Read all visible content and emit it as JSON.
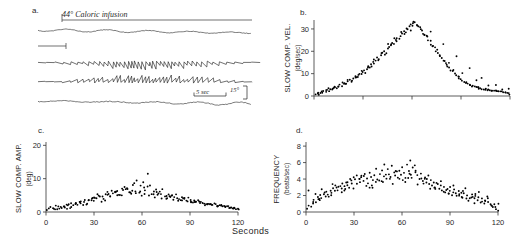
{
  "figure": {
    "xlabel": "Seconds",
    "panels": [
      {
        "id": "a",
        "letter": "a."
      },
      {
        "id": "b",
        "letter": "b."
      },
      {
        "id": "c",
        "letter": "c."
      },
      {
        "id": "d",
        "letter": "d."
      }
    ]
  },
  "panel_a": {
    "letter": "a.",
    "annotation": "44° Caloric infusion",
    "scale_time": "5 sec",
    "scale_amplitude": "15°",
    "trace_count": 4,
    "description": "electro-oculographic nystagmus traces"
  },
  "chart_data": [
    {
      "id": "b",
      "type": "scatter",
      "letter": "b.",
      "title": "",
      "ylabel": "SLOW COMP. VEL.",
      "yunit": "(deg/sec)",
      "xlabel": "",
      "xticks": [
        0,
        30,
        60,
        90,
        120
      ],
      "xticklabels": [
        "",
        "",
        "",
        "",
        ""
      ],
      "yticks": [
        0,
        10,
        20,
        30
      ],
      "yticklabels": [
        "0",
        "10",
        "20",
        "30"
      ],
      "xlim": [
        0,
        120
      ],
      "ylim": [
        0,
        34
      ],
      "grid": false,
      "legend": null,
      "x": [
        1,
        2,
        3,
        4,
        5,
        6,
        7,
        8,
        9,
        10,
        11,
        12,
        13,
        14,
        15,
        16,
        17,
        18,
        19,
        20,
        21,
        22,
        23,
        24,
        25,
        26,
        27,
        28,
        29,
        30,
        31,
        32,
        33,
        34,
        35,
        36,
        37,
        38,
        39,
        40,
        41,
        42,
        43,
        44,
        45,
        46,
        47,
        48,
        49,
        50,
        51,
        52,
        53,
        54,
        55,
        56,
        57,
        58,
        59,
        60,
        61,
        62,
        63,
        64,
        65,
        66,
        67,
        68,
        69,
        70,
        71,
        72,
        73,
        74,
        75,
        76,
        77,
        78,
        79,
        80,
        81,
        82,
        83,
        84,
        85,
        86,
        87,
        88,
        89,
        90,
        91,
        92,
        93,
        94,
        95,
        96,
        97,
        98,
        99,
        100,
        101,
        102,
        103,
        104,
        105,
        106,
        107,
        108,
        109,
        110,
        111,
        112,
        113,
        114,
        115,
        116,
        117,
        118,
        119,
        120,
        5,
        9,
        13,
        17,
        21,
        25,
        29,
        33,
        37,
        41,
        45,
        49,
        53,
        57,
        61,
        65,
        69,
        73,
        77,
        81,
        85,
        89,
        93,
        97,
        101,
        105,
        109,
        113,
        117,
        3,
        11,
        19,
        27,
        35,
        43,
        51,
        59,
        67,
        75,
        83,
        91,
        99,
        107,
        115,
        7,
        15,
        23,
        31,
        39,
        47,
        55,
        63,
        71,
        79,
        87,
        95,
        103,
        111,
        119
      ],
      "y": [
        0.5,
        1.0,
        0.8,
        1.5,
        1.2,
        2.0,
        1.8,
        2.5,
        2.2,
        3.0,
        2.8,
        3.5,
        4.0,
        3.6,
        4.5,
        5.0,
        4.6,
        5.5,
        6.0,
        5.6,
        6.5,
        7.2,
        7.0,
        8.0,
        8.5,
        8.2,
        9.5,
        10.0,
        9.6,
        11.0,
        11.5,
        12.0,
        13.0,
        12.6,
        14.0,
        15.0,
        14.5,
        16.0,
        17.0,
        16.5,
        18.0,
        19.5,
        20.0,
        19.0,
        21.5,
        22.0,
        23.0,
        24.0,
        23.5,
        25.0,
        26.0,
        25.5,
        27.0,
        28.0,
        29.0,
        28.5,
        30.0,
        31.0,
        32.0,
        31.5,
        32.5,
        33.0,
        32.0,
        31.0,
        30.5,
        29.5,
        28.0,
        27.5,
        26.5,
        25.0,
        24.5,
        23.0,
        22.0,
        21.5,
        20.0,
        19.0,
        18.5,
        17.0,
        16.0,
        15.5,
        14.0,
        13.5,
        12.5,
        11.5,
        11.0,
        10.0,
        9.5,
        9.0,
        8.0,
        7.5,
        7.0,
        6.5,
        6.0,
        5.5,
        5.0,
        4.8,
        4.5,
        4.2,
        4.0,
        3.8,
        3.5,
        3.4,
        3.2,
        3.0,
        3.0,
        2.8,
        2.7,
        2.5,
        2.4,
        2.3,
        2.2,
        2.0,
        2.0,
        1.8,
        1.8,
        1.6,
        1.5,
        1.4,
        1.2,
        0.8,
        2.0,
        3.2,
        4.2,
        5.8,
        7.0,
        9.0,
        11.2,
        13.5,
        16.5,
        19.0,
        23.0,
        26.0,
        28.5,
        30.0,
        33.5,
        30.0,
        27.0,
        22.5,
        18.0,
        14.5,
        11.5,
        8.5,
        6.0,
        4.6,
        3.6,
        3.0,
        2.6,
        2.0,
        1.6,
        1.4,
        3.0,
        5.2,
        8.8,
        13.2,
        18.5,
        24.5,
        29.5,
        27.5,
        21.0,
        15.0,
        10.5,
        7.0,
        4.4,
        3.0,
        2.4,
        4.0,
        6.6,
        10.5,
        16.0,
        22.5,
        28.0,
        31.5,
        29.0,
        23.5,
        17.5,
        12.5,
        8.0,
        5.0,
        3.2,
        1.0
      ]
    },
    {
      "id": "c",
      "type": "scatter",
      "letter": "c.",
      "title": "",
      "ylabel": "SLOW COMP. AMP.",
      "yunit": "(deg)",
      "xlabel": "Seconds",
      "xticks": [
        0,
        30,
        60,
        90,
        120
      ],
      "xticklabels": [
        "0",
        "30",
        "60",
        "90",
        "120"
      ],
      "yticks": [
        0,
        10,
        20
      ],
      "yticklabels": [
        "0",
        "10",
        "20"
      ],
      "xlim": [
        0,
        120
      ],
      "ylim": [
        0,
        21
      ],
      "grid": false,
      "legend": null,
      "x": [
        2,
        4,
        6,
        8,
        10,
        12,
        14,
        16,
        18,
        20,
        22,
        24,
        26,
        28,
        30,
        32,
        34,
        36,
        38,
        40,
        42,
        44,
        46,
        48,
        50,
        52,
        54,
        56,
        58,
        60,
        62,
        64,
        66,
        68,
        70,
        72,
        74,
        76,
        78,
        80,
        82,
        84,
        86,
        88,
        90,
        92,
        94,
        96,
        98,
        100,
        102,
        104,
        106,
        108,
        110,
        112,
        114,
        116,
        118,
        120,
        3,
        7,
        11,
        15,
        19,
        23,
        27,
        31,
        35,
        39,
        43,
        47,
        51,
        55,
        59,
        63,
        67,
        71,
        75,
        79,
        83,
        87,
        91,
        95,
        99,
        103,
        107,
        111,
        115,
        119,
        5,
        9,
        13,
        17,
        21,
        25,
        29,
        33,
        37,
        41,
        45,
        49,
        53,
        57,
        61,
        65,
        69,
        73,
        77,
        81,
        85,
        89,
        93,
        97,
        101,
        105,
        109,
        113,
        117,
        1,
        6,
        14,
        22,
        30,
        38,
        46,
        54,
        62,
        70,
        78,
        86,
        94,
        102,
        110,
        118,
        8,
        16,
        24,
        32,
        40,
        48,
        56,
        64,
        72,
        80,
        88,
        96,
        104,
        112,
        120,
        11,
        19,
        27,
        35,
        43,
        51,
        59,
        67,
        75,
        83,
        91,
        99,
        107,
        115,
        13,
        21,
        29,
        37,
        45,
        53,
        61,
        69,
        77,
        85,
        93,
        101,
        109,
        117
      ],
      "y": [
        1.0,
        1.2,
        0.9,
        1.5,
        1.1,
        1.3,
        1.8,
        1.5,
        2.2,
        2.0,
        2.6,
        3.0,
        2.4,
        3.5,
        3.2,
        4.0,
        4.5,
        3.8,
        5.0,
        4.6,
        5.5,
        6.0,
        5.2,
        6.5,
        7.0,
        5.8,
        6.2,
        5.5,
        6.0,
        5.0,
        5.5,
        4.8,
        5.2,
        4.5,
        5.0,
        4.2,
        4.6,
        4.0,
        4.4,
        3.8,
        4.0,
        3.5,
        3.8,
        3.2,
        3.5,
        3.0,
        3.2,
        2.6,
        2.8,
        2.2,
        2.4,
        2.0,
        2.2,
        1.8,
        2.0,
        1.6,
        1.8,
        1.4,
        1.2,
        1.0,
        1.4,
        1.0,
        1.6,
        1.2,
        2.4,
        2.0,
        3.6,
        4.4,
        3.0,
        5.6,
        6.2,
        4.8,
        7.0,
        8.5,
        6.0,
        7.5,
        5.4,
        6.2,
        4.0,
        5.0,
        3.4,
        4.2,
        2.8,
        3.4,
        2.2,
        2.6,
        1.8,
        2.0,
        1.4,
        0.8,
        0.8,
        1.4,
        1.0,
        2.0,
        2.8,
        2.2,
        4.0,
        5.0,
        3.4,
        6.5,
        5.2,
        7.5,
        6.0,
        9.5,
        7.2,
        8.0,
        5.8,
        6.8,
        4.6,
        5.4,
        3.6,
        4.4,
        2.8,
        3.2,
        2.4,
        2.6,
        2.0,
        1.6,
        1.2,
        0.6,
        1.8,
        2.2,
        3.2,
        4.2,
        6.0,
        5.0,
        8.0,
        6.5,
        5.5,
        4.8,
        4.2,
        3.0,
        2.4,
        1.8,
        1.4,
        1.2,
        2.6,
        3.8,
        5.5,
        4.5,
        7.0,
        6.0,
        11.5,
        5.2,
        4.4,
        3.6,
        3.0,
        2.2,
        1.6,
        0.9,
        1.8,
        2.8,
        3.4,
        4.8,
        5.8,
        6.8,
        7.8,
        6.2,
        5.0,
        4.0,
        3.2,
        2.4,
        1.8,
        1.0,
        2.2,
        3.0,
        4.2,
        5.2,
        6.4,
        5.6,
        9.0,
        6.6,
        5.2,
        4.4,
        3.4,
        2.6,
        1.9,
        1.1
      ]
    },
    {
      "id": "d",
      "type": "scatter",
      "letter": "d.",
      "title": "",
      "ylabel": "FREQUENCY",
      "yunit": "(beats/sec)",
      "xlabel": "Seconds",
      "xticks": [
        0,
        30,
        60,
        90,
        120
      ],
      "xticklabels": [
        "0",
        "30",
        "60",
        "90",
        "120"
      ],
      "yticks": [
        0,
        2,
        4,
        6,
        8
      ],
      "yticklabels": [
        "0",
        "2",
        "4",
        "6",
        "8"
      ],
      "xlim": [
        0,
        120
      ],
      "ylim": [
        0,
        8.5
      ],
      "grid": false,
      "legend": null,
      "x": [
        1,
        2,
        3,
        4,
        5,
        6,
        7,
        8,
        9,
        10,
        11,
        12,
        13,
        14,
        15,
        16,
        17,
        18,
        19,
        20,
        21,
        22,
        23,
        24,
        25,
        26,
        27,
        28,
        29,
        30,
        31,
        32,
        33,
        34,
        35,
        36,
        37,
        38,
        39,
        40,
        41,
        42,
        43,
        44,
        45,
        46,
        47,
        48,
        49,
        50,
        51,
        52,
        53,
        54,
        55,
        56,
        57,
        58,
        59,
        60,
        61,
        62,
        63,
        64,
        65,
        66,
        67,
        68,
        69,
        70,
        71,
        72,
        73,
        74,
        75,
        76,
        77,
        78,
        79,
        80,
        81,
        82,
        83,
        84,
        85,
        86,
        87,
        88,
        89,
        90,
        91,
        92,
        93,
        94,
        95,
        96,
        97,
        98,
        99,
        100,
        101,
        102,
        103,
        104,
        105,
        106,
        107,
        108,
        109,
        110,
        111,
        112,
        113,
        114,
        115,
        116,
        117,
        118,
        119,
        120,
        4,
        8,
        12,
        16,
        20,
        24,
        28,
        32,
        36,
        40,
        44,
        48,
        52,
        56,
        60,
        64,
        68,
        72,
        76,
        80,
        84,
        88,
        92,
        96,
        100,
        104,
        108,
        112,
        116,
        120,
        6,
        10,
        14,
        18,
        22,
        26,
        30,
        34,
        38,
        42,
        46,
        50,
        54,
        58,
        62,
        66,
        70,
        74,
        78,
        82,
        86,
        90,
        94,
        98,
        102,
        106,
        110,
        114,
        118,
        2,
        9,
        17,
        25,
        33,
        41,
        49,
        57,
        65,
        73,
        81,
        89,
        97,
        105,
        113,
        119
      ],
      "y": [
        0.4,
        0.8,
        0.6,
        1.0,
        1.4,
        1.1,
        1.8,
        1.5,
        2.0,
        1.7,
        2.2,
        1.9,
        2.4,
        2.1,
        2.6,
        2.3,
        2.8,
        2.5,
        3.0,
        2.7,
        3.2,
        2.9,
        3.4,
        3.1,
        3.6,
        3.3,
        3.0,
        3.8,
        3.5,
        4.2,
        3.9,
        4.5,
        4.0,
        3.6,
        4.4,
        3.8,
        4.6,
        4.1,
        3.5,
        4.8,
        4.2,
        3.9,
        4.4,
        3.6,
        4.0,
        4.6,
        3.8,
        5.0,
        4.4,
        4.0,
        5.2,
        4.6,
        4.2,
        5.6,
        4.8,
        4.4,
        5.0,
        4.0,
        4.6,
        5.4,
        4.8,
        4.2,
        5.8,
        5.0,
        6.2,
        4.6,
        5.4,
        4.8,
        5.0,
        4.4,
        4.0,
        4.6,
        3.8,
        4.2,
        3.6,
        4.0,
        3.4,
        3.8,
        3.2,
        3.6,
        3.0,
        3.4,
        2.8,
        3.2,
        2.6,
        3.0,
        2.4,
        2.8,
        2.2,
        2.6,
        2.0,
        2.4,
        2.8,
        2.2,
        2.6,
        2.0,
        2.4,
        1.8,
        2.2,
        1.6,
        2.0,
        1.4,
        1.8,
        2.2,
        1.6,
        2.0,
        1.4,
        1.8,
        1.2,
        1.6,
        1.0,
        1.4,
        1.8,
        1.2,
        1.0,
        0.8,
        0.6,
        1.0,
        0.4,
        0.2,
        1.2,
        1.6,
        2.4,
        2.0,
        3.0,
        2.6,
        4.0,
        3.4,
        4.4,
        3.0,
        5.2,
        3.6,
        4.0,
        5.0,
        3.8,
        4.2,
        5.6,
        4.0,
        4.4,
        3.0,
        3.8,
        2.6,
        3.2,
        2.2,
        2.8,
        1.8,
        2.4,
        1.4,
        0.8,
        1.0,
        2.2,
        2.8,
        1.8,
        3.2,
        2.4,
        3.6,
        2.8,
        4.2,
        3.2,
        3.0,
        3.8,
        4.6,
        3.4,
        5.0,
        3.6,
        4.2,
        3.4,
        4.0,
        2.8,
        3.6,
        2.4,
        3.0,
        2.0,
        2.6,
        1.6,
        2.2,
        1.2,
        1.6,
        0.6,
        2.6,
        1.4,
        3.4,
        2.8,
        4.0,
        3.2,
        5.8,
        4.2,
        4.6,
        3.4,
        2.8,
        2.2,
        1.8,
        1.0
      ]
    }
  ]
}
